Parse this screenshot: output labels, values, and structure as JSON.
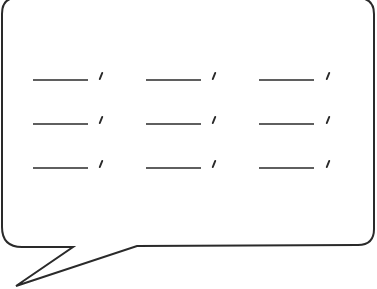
{
  "figure": {
    "stroke_color": "#2a2a2a",
    "fill_color": "#ffffff",
    "rows": [
      {
        "y": 80,
        "blanks": [
          {
            "x1": 33,
            "x2": 88,
            "comma_x": 101
          },
          {
            "x1": 146,
            "x2": 201,
            "comma_x": 214
          },
          {
            "x1": 259,
            "x2": 314,
            "comma_x": 328
          }
        ]
      },
      {
        "y": 124,
        "blanks": [
          {
            "x1": 33,
            "x2": 88,
            "comma_x": 101
          },
          {
            "x1": 146,
            "x2": 201,
            "comma_x": 214
          },
          {
            "x1": 259,
            "x2": 314,
            "comma_x": 328
          }
        ]
      },
      {
        "y": 168,
        "blanks": [
          {
            "x1": 33,
            "x2": 88,
            "comma_x": 101
          },
          {
            "x1": 146,
            "x2": 201,
            "comma_x": 214
          },
          {
            "x1": 259,
            "x2": 314,
            "comma_x": 328
          }
        ]
      }
    ]
  }
}
